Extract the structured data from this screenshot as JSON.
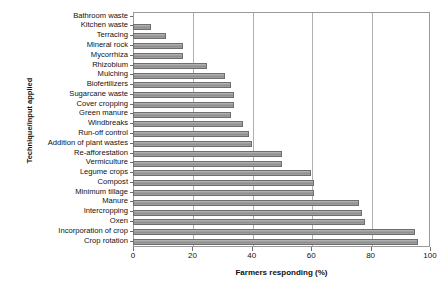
{
  "chart_data": {
    "type": "bar",
    "orientation": "horizontal",
    "title": "",
    "xlabel": "Farmers responding (%)",
    "ylabel": "Technique/input applied",
    "xlim": [
      0,
      100
    ],
    "xticks": [
      0,
      20,
      40,
      60,
      80,
      100
    ],
    "grid": true,
    "legend": false,
    "bar_color": "#9e9e9e",
    "bar_edge_color": "#6e6e6e",
    "categories": [
      "Bathroom waste",
      "Kitchen  waste",
      "Terracing",
      "Mineral rock",
      "Mycorrhiza",
      "Rhizobium",
      "Mulching",
      "Biofertilizers",
      "Sugarcane waste",
      "Cover cropping",
      "Green manure",
      "Windbreaks",
      "Run-off control",
      "Addition of plant wastes",
      "Re-afforestation",
      "Vermiculture",
      "Legume crops",
      "Compost",
      "Minimum tillage",
      "Manure",
      "Intercropping",
      "Oxen",
      "Incorporation of crop",
      "Crop rotation"
    ],
    "values": [
      0,
      6,
      11,
      17,
      17,
      25,
      31,
      33,
      34,
      34,
      33,
      37,
      39,
      40,
      50,
      50,
      60,
      61,
      61,
      76,
      77,
      78,
      95,
      96
    ]
  }
}
